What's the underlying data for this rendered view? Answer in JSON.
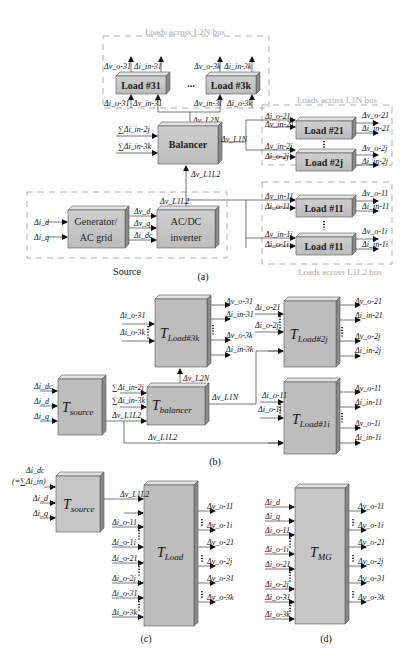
{
  "panel_a": {
    "caption": "(a)",
    "groups": {
      "l2n": "Loads across L2N bus",
      "l1n": "Loads across L1N bus",
      "l1l2": "Loads across L1L2 bus",
      "source": "Source"
    },
    "blocks": {
      "load31": "Load #31",
      "load3k": "Load #3k",
      "ellipsis": "...",
      "balancer": "Balancer",
      "load21": "Load #21",
      "load2j": "Load #2j",
      "load11": "Load #11",
      "load1i": "Load #11",
      "gen_line1": "Generator/",
      "gen_line2": "AC grid",
      "inv_line1": "AC/DC",
      "inv_line2": "inverter"
    },
    "signals": {
      "vo31": "Δv_o-31",
      "iin31": "Δi_in-31",
      "io31": "Δi_o-31",
      "vin31": "Δv_in-31",
      "vo3k": "Δv_o-3k",
      "iin3k": "Δi_in-3k",
      "vin3k": "Δv_in-3l",
      "io3k": "Δi_o-3k",
      "vl2n": "Δv_L2N",
      "sum_in2j": "∑Δi_in-2j",
      "sum_in3k": "∑Δi_in-3k",
      "vl1n": "Δv_L1N",
      "vl1l2": "Δv_L1L2",
      "vl1l2b": "Δv_L1L2",
      "io21": "Δi_o-21",
      "vin21": "Δv_in-21",
      "vo21": "Δv_o-21",
      "iin21": "Δi_in-21",
      "vin2j": "Δv_in-2j",
      "io2j": "Δi_o-2j",
      "vo2j": "Δv_o-2j",
      "iin2j": "Δi_in-2j",
      "vin11": "Δv_in-11",
      "io11": "Δi_o-11",
      "vo11": "Δv_o-11",
      "iin11": "Δi_in-11",
      "vin1i": "Δv_in-1i",
      "io1i": "Δi_o-1i",
      "vo1i": "Δv_o-1i",
      "iin1i": "Δi_in-1i",
      "id": "Δi_d",
      "iq": "Δi_q",
      "vd": "Δv_d",
      "vq": "Δv_q",
      "idc": "Δi_dc"
    }
  },
  "panel_b": {
    "caption": "(b)",
    "blocks": {
      "tload3k": {
        "T": "T",
        "sub": "Load#3k"
      },
      "tload2j": {
        "T": "T",
        "sub": "Load#2j"
      },
      "tload1i": {
        "T": "T",
        "sub": "Load#1i"
      },
      "tsource": {
        "T": "T",
        "sub": "source"
      },
      "tbalancer": {
        "T": "T",
        "sub": "balancer"
      }
    },
    "signals": {
      "io31": "Δi_o-31",
      "io3k": "Δi_o-3k",
      "vo31": "Δv_o-31",
      "iin31": "Δi_in-31",
      "vo3k": "Δv_o-3k",
      "iin3k": "Δi_in-3k",
      "io21": "Δi_o-21",
      "io2j": "Δi_o-2j",
      "vo21": "Δv_o-21",
      "iin21": "Δi_in-21",
      "vo2j": "Δv_o-2j",
      "iin2j": "Δi_in-2j",
      "idc": "Δi_dc",
      "id": "Δi_d",
      "iq": "Δi_q",
      "sum_in2j": "∑Δi_in-2j",
      "sum_in3k": "∑Δi_in-3k",
      "vl1l2": "Δv_L1L2",
      "vl2n": "Δv_L2N",
      "vl1n": "Δv_L1N",
      "vl1l2b": "Δv_L1L2",
      "io11": "Δi_o-11",
      "io1i": "Δi_o-1i",
      "vo11": "Δv_o-11",
      "iin11": "Δi_in-11",
      "vo1i": "Δv_o-1i",
      "iin1i": "Δi_in-1i"
    }
  },
  "panel_c": {
    "caption": "(c)",
    "tsource": {
      "T": "T",
      "sub": "source"
    },
    "tload": {
      "T": "T",
      "sub": "Load"
    },
    "source_inputs": [
      "Δi_dc",
      "(=∑Δi_in)",
      "Δi_d",
      "Δi_q"
    ],
    "link": "Δv_L1L2",
    "inputs": [
      "Δi_o-11",
      "Δi_o-1i",
      "Δi_o-21",
      "Δi_o-2j",
      "Δi_o-31",
      "Δi_o-3k"
    ],
    "outputs": [
      "Δv_o-11",
      "Δv_o-1i",
      "Δv_o-21",
      "Δv_o-2j",
      "Δv_o-31",
      "Δv_o-3k"
    ]
  },
  "panel_d": {
    "caption": "(d)",
    "tmg": {
      "T": "T",
      "sub": "MG"
    },
    "inputs": [
      "Δi_d",
      "Δi_q",
      "Δi_o-11",
      "Δi_o-1i",
      "Δi_o-21",
      "Δi_o-2j",
      "Δi_o-31",
      "Δi_o-3k"
    ],
    "outputs": [
      "Δv_o-11",
      "Δv_o-1i",
      "Δv_o-21",
      "Δv_o-2j",
      "Δv_o-31",
      "Δv_o-3k"
    ]
  },
  "colors": {
    "block_fill": "#c8c8c8",
    "block_side": "#8a8a8a",
    "block_top": "#e2e2e2",
    "t_block_fill": "#bdbdbd",
    "group_label": "#aaaaaa"
  }
}
